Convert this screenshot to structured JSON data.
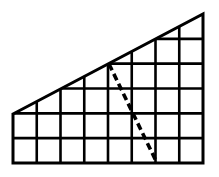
{
  "diagram": {
    "grid": {
      "columns": 8,
      "rows": 6,
      "x0": 13,
      "x1": 203,
      "y0": 14,
      "y1": 163
    },
    "shape": {
      "type": "trapezoid",
      "vertices": [
        [
          13,
          114
        ],
        [
          203,
          14
        ],
        [
          203,
          163
        ],
        [
          13,
          163
        ]
      ]
    },
    "dashed_segment": {
      "from": [
        109,
        64
      ],
      "to": [
        157,
        163
      ]
    },
    "colors": {
      "line": "#000000",
      "background": "#ffffff"
    }
  }
}
